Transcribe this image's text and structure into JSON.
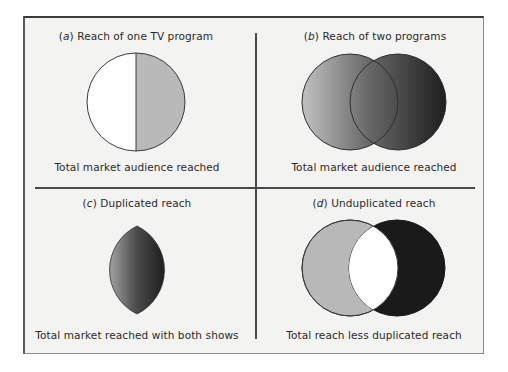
{
  "figure": {
    "panels": [
      {
        "id": "a",
        "tag": "a",
        "title": "Reach of one TV program",
        "caption": "Total market audience reached",
        "shapes": "single circle, half shaded"
      },
      {
        "id": "b",
        "tag": "b",
        "title": "Reach of two programs",
        "caption": "Total market audience reached",
        "shapes": "two overlapping circles, gradient shaded"
      },
      {
        "id": "c",
        "tag": "c",
        "title": "Duplicated reach",
        "caption": "Total market reached with both shows",
        "shapes": "lens (overlap region), gradient shaded"
      },
      {
        "id": "d",
        "tag": "d",
        "title": "Unduplicated reach",
        "caption": "Total reach less duplicated reach",
        "shapes": "two overlapping circles, overlap white"
      }
    ],
    "colors": {
      "panel_background": "#f3f3f2",
      "outline": "#3a3a3a",
      "light_gray": "#b8b8b8",
      "white": "#ffffff",
      "black": "#1a1a1a",
      "gradient_light": "#bdbdbd",
      "gradient_dark": "#262626"
    }
  }
}
